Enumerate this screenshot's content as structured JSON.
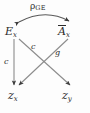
{
  "diagram": {
    "type": "path-diagram",
    "background_color": "#fdfdfd",
    "stroke_color": "#4a4a4a",
    "text_color": "#2b2b2b",
    "nodes": [
      {
        "id": "Ex",
        "label": "E",
        "subscript": "x",
        "overbar": false,
        "position": "top-left"
      },
      {
        "id": "Abar_x",
        "label": "A",
        "subscript": "x",
        "overbar": true,
        "position": "top-right"
      },
      {
        "id": "zx",
        "label": "z",
        "subscript": "x",
        "overbar": false,
        "position": "bottom-left"
      },
      {
        "id": "zy",
        "label": "z",
        "subscript": "y",
        "overbar": false,
        "position": "bottom-right"
      }
    ],
    "edges": [
      {
        "id": "ex-to-zx",
        "from": "Ex",
        "to": "zx",
        "label": "c",
        "arrow": "single"
      },
      {
        "id": "ex-to-zy",
        "from": "Ex",
        "to": "zy",
        "label": "c",
        "arrow": "single"
      },
      {
        "id": "ax-to-zx",
        "from": "Abar_x",
        "to": "zx",
        "label": "g",
        "arrow": "single"
      }
    ],
    "correlation": {
      "id": "rho-ge",
      "symbol": "ρ",
      "subscript": "GE",
      "between": [
        "Ex",
        "Abar_x"
      ],
      "arrow": "double"
    }
  }
}
